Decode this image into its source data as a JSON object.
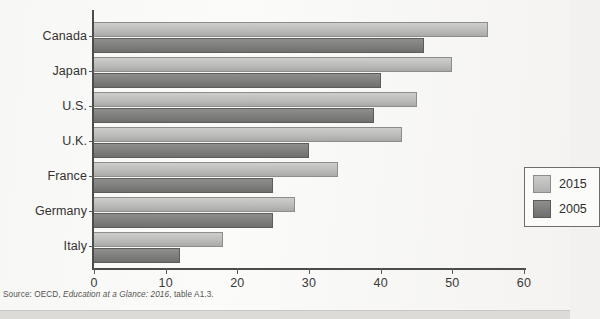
{
  "chart_data": {
    "type": "bar",
    "orientation": "horizontal",
    "title": "",
    "subtitle": "",
    "xlabel": "",
    "ylabel": "",
    "xlim": [
      0,
      60
    ],
    "xticks": [
      "0",
      "10",
      "20",
      "30",
      "40",
      "50",
      "60"
    ],
    "grid": false,
    "legend_position": "inside-right-middle",
    "categories": [
      "Canada",
      "Japan",
      "U.S.",
      "U.K.",
      "France",
      "Germany",
      "Italy"
    ],
    "series": [
      {
        "name": "2015",
        "color": "#bcbcba",
        "values": [
          55,
          50,
          45,
          43,
          34,
          28,
          18
        ]
      },
      {
        "name": "2005",
        "color": "#7e7e7c",
        "values": [
          46,
          40,
          39,
          30,
          25,
          25,
          12
        ]
      }
    ]
  },
  "legend": {
    "entries": [
      {
        "label": "2015",
        "swatch": "light-gray-swatch"
      },
      {
        "label": "2005",
        "swatch": "dark-gray-swatch"
      }
    ]
  },
  "source": {
    "prefix": "Source: OECD, ",
    "italic_title": "Education at a Glance: 2016",
    "suffix": ", table A1.3."
  },
  "colors": {
    "series_2015": "#bcbcba",
    "series_2005": "#7e7e7c",
    "axis": "#4c4c4c",
    "text": "#33322f",
    "page_background": "#f7f7f5"
  }
}
